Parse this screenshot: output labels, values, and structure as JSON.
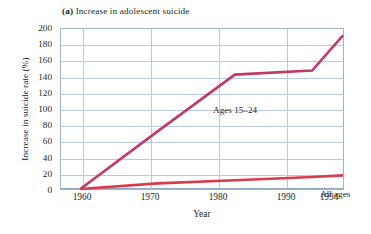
{
  "figure": {
    "panel_label": "(a)",
    "title": "Increase in adolescent suicide"
  },
  "axes": {
    "ylabel": "Increase in suicide rate (%)",
    "xlabel": "Year",
    "yticks": [
      "0",
      "20",
      "40",
      "60",
      "80",
      "100",
      "120",
      "140",
      "160",
      "180",
      "200"
    ],
    "xticks": [
      "1960",
      "1970",
      "1980",
      "1990",
      "1994"
    ]
  },
  "annotations": {
    "teen_series": "Ages 15–24",
    "all_series": "All ages"
  },
  "colors": {
    "teen_line": "#c0396b",
    "all_line": "#da3b4a",
    "grid": "#b9cade",
    "frame": "#9fb6cf",
    "text": "#231f20"
  },
  "chart_data": {
    "type": "line",
    "title": "(a) Increase in adolescent suicide",
    "xlabel": "Year",
    "ylabel": "Increase in suicide rate (%)",
    "xlim": [
      1957.5,
      1994
    ],
    "ylim": [
      0,
      200
    ],
    "grid": true,
    "legend": "inline-annotations",
    "x": [
      1960,
      1970,
      1980,
      1990,
      1994
    ],
    "series": [
      {
        "name": "Ages 15–24",
        "color": "#c0396b",
        "values": [
          0,
          72,
          143,
          148,
          192
        ]
      },
      {
        "name": "All ages",
        "color": "#da3b4a",
        "values": [
          0,
          7,
          11,
          15,
          17
        ]
      }
    ]
  }
}
